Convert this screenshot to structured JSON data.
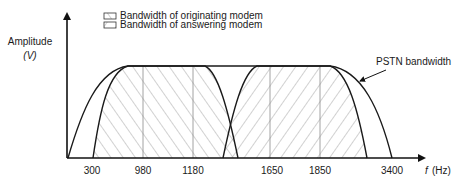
{
  "legend": {
    "originating": "Bandwidth of originating modem",
    "answering": "Bandwidth of answering modem"
  },
  "axes": {
    "y_label": "Amplitude",
    "y_unit": "(V)",
    "x_label": "f",
    "x_unit": "(Hz)"
  },
  "annotation": {
    "pstn": "PSTN bandwidth"
  },
  "ticks": [
    "300",
    "980",
    "1180",
    "1650",
    "1850",
    "3400"
  ],
  "colors": {
    "line": "#1a1a1a",
    "hatch": "#9a9a9a",
    "background": "#ffffff"
  }
}
